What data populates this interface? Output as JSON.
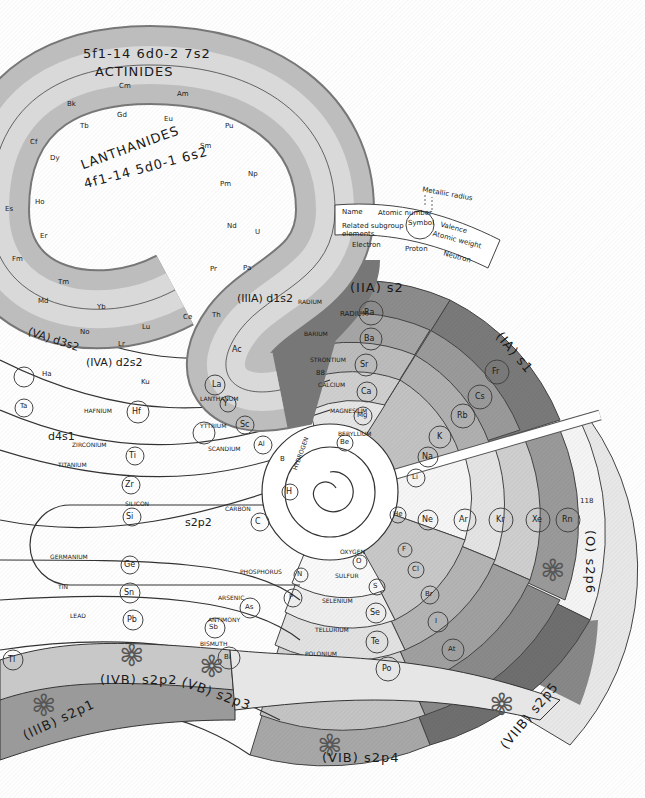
{
  "diagram": {
    "headers": {
      "actinides_config": "5f1-14 6d0-2 7s2",
      "actinides": "ACTINIDES",
      "lanthanides": "LANTHANIDES",
      "lanthanides_config": "4f1-14 5d0-1 6s2",
      "group_IIA": "(IIA) s2",
      "group_IA": "(IA) s1",
      "group_IIIA": "(IIIA) d1s2",
      "group_IVA": "(IVA) d2s2",
      "group_VA": "(VA) d3s2",
      "group_0": "(O) s2p6",
      "group_IIIB": "(IIIB) s2p1",
      "group_IVB": "(IVB) s2p2",
      "group_VB": "(VB) s2p3",
      "group_VIB": "(VIB) s2p4",
      "group_VIIB": "(VIIB) s2p5",
      "sp_s2p2": "s2p2",
      "d4s1": "d4s1",
      "s2p1_inner": "s2p1"
    },
    "legend": {
      "name": "Name",
      "atomic_number": "Atomic number",
      "symbol": "Symbol",
      "valence": "Valence",
      "atomic_weight": "Atomic weight",
      "related": "Related subgroup elements",
      "metallic_radius": "Metallic radius",
      "electron": "Electron",
      "proton": "Proton",
      "neutron": "Neutron"
    },
    "actinides": [
      {
        "n": "98",
        "sym": "Cf",
        "name": "CALIFORNIUM"
      },
      {
        "n": "97",
        "sym": "Bk",
        "name": "BERKELIUM"
      },
      {
        "n": "96",
        "sym": "Cm",
        "name": "CURIUM"
      },
      {
        "n": "95",
        "sym": "Am",
        "name": "AMERICIUM"
      },
      {
        "n": "94",
        "sym": "Pu",
        "name": "PLUTONIUM"
      },
      {
        "n": "93",
        "sym": "Np",
        "name": "NEPTUNIUM"
      },
      {
        "n": "92",
        "sym": "U",
        "name": "URANIUM"
      },
      {
        "n": "91",
        "sym": "Pa",
        "name": "PROTACTINIUM"
      },
      {
        "n": "90",
        "sym": "Th",
        "name": "THORIUM"
      },
      {
        "n": "89",
        "sym": "Ac",
        "name": "ACTINIUM"
      },
      {
        "n": "99",
        "sym": "Es",
        "name": "EINSTEINIUM"
      },
      {
        "n": "100",
        "sym": "Fm",
        "name": "FERMIUM"
      },
      {
        "n": "101",
        "sym": "Md",
        "name": "MENDELEVIUM"
      },
      {
        "n": "102",
        "sym": "No",
        "name": "NOBELIUM"
      },
      {
        "n": "103",
        "sym": "Lr",
        "name": "LAWRENCIUM"
      }
    ],
    "lanthanides": [
      {
        "n": "66",
        "sym": "Dy",
        "name": "DYSPROSIUM"
      },
      {
        "n": "65",
        "sym": "Tb",
        "name": "TERBIUM"
      },
      {
        "n": "64",
        "sym": "Gd",
        "name": "GADOLINIUM"
      },
      {
        "n": "63",
        "sym": "Eu",
        "name": "EUROPIUM"
      },
      {
        "n": "62",
        "sym": "Sm",
        "name": "SAMARIUM"
      },
      {
        "n": "61",
        "sym": "Pm",
        "name": "PROMETHIUM"
      },
      {
        "n": "60",
        "sym": "Nd",
        "name": "NEODYMIUM"
      },
      {
        "n": "59",
        "sym": "Pr",
        "name": "PRASEODYMIUM"
      },
      {
        "n": "58",
        "sym": "Ce",
        "name": "CERIUM"
      },
      {
        "n": "57",
        "sym": "La",
        "name": "LANTHANUM"
      },
      {
        "n": "67",
        "sym": "Ho",
        "name": "HOLMIUM"
      },
      {
        "n": "68",
        "sym": "Er",
        "name": "ERBIUM"
      },
      {
        "n": "69",
        "sym": "Tm",
        "name": "THULIUM"
      },
      {
        "n": "70",
        "sym": "Yb",
        "name": "YTTERBIUM"
      },
      {
        "n": "71",
        "sym": "Lu",
        "name": "LUTETIUM"
      }
    ],
    "group_IIA": [
      {
        "n": "88",
        "sym": "Ra",
        "name": "RADIUM"
      },
      {
        "n": "56",
        "sym": "Ba",
        "name": "BARIUM"
      },
      {
        "n": "38",
        "sym": "Sr",
        "name": "STRONTIUM"
      },
      {
        "n": "20",
        "sym": "Ca",
        "name": "CALCIUM"
      },
      {
        "n": "12",
        "sym": "Mg",
        "name": "MAGNESIUM"
      },
      {
        "n": "4",
        "sym": "Be",
        "name": "BERYLLIUM"
      }
    ],
    "group_IA": [
      {
        "n": "87",
        "sym": "Fr",
        "name": "FRANCIUM"
      },
      {
        "n": "55",
        "sym": "Cs",
        "name": "CESIUM"
      },
      {
        "n": "37",
        "sym": "Rb",
        "name": "RUBIDIUM"
      },
      {
        "n": "19",
        "sym": "K",
        "name": "POTASSIUM"
      },
      {
        "n": "11",
        "sym": "Na",
        "name": "SODIUM"
      },
      {
        "n": "3",
        "sym": "Li",
        "name": "LITHIUM"
      }
    ],
    "group_0": [
      {
        "n": "2",
        "sym": "He",
        "name": "HELIUM"
      },
      {
        "n": "10",
        "sym": "Ne",
        "name": "NEON"
      },
      {
        "n": "18",
        "sym": "Ar",
        "name": "ARGON"
      },
      {
        "n": "36",
        "sym": "Kr",
        "name": "KRYPTON"
      },
      {
        "n": "54",
        "sym": "Xe",
        "name": "XENON"
      },
      {
        "n": "86",
        "sym": "Rn",
        "name": "RADON"
      },
      {
        "n": "118",
        "sym": "*",
        "name": ""
      }
    ],
    "group_IIIA": [
      {
        "n": "21",
        "sym": "Sc",
        "name": "SCANDIUM"
      },
      {
        "n": "39",
        "sym": "Y",
        "name": "YTTRIUM"
      }
    ],
    "group_IVA": [
      {
        "n": "22",
        "sym": "Ti",
        "name": "TITANIUM"
      },
      {
        "n": "40",
        "sym": "Zr",
        "name": "ZIRCONIUM"
      },
      {
        "n": "72",
        "sym": "Hf",
        "name": "HAFNIUM"
      },
      {
        "n": "104",
        "sym": "Ku",
        "name": "KURCHATOVIUM"
      }
    ],
    "group_VA": [
      {
        "n": "73",
        "sym": "Ta",
        "name": "TANTALUM"
      },
      {
        "n": "105",
        "sym": "Ha",
        "name": "HAHNIUM"
      }
    ],
    "group_IIIB": [
      {
        "n": "13",
        "sym": "Al",
        "name": "ALUMINIUM"
      },
      {
        "n": "5",
        "sym": "B",
        "name": "BORON"
      },
      {
        "n": "81",
        "sym": "Tl",
        "name": "THALLIUM"
      },
      {
        "n": "113",
        "sym": "*",
        "name": ""
      }
    ],
    "group_IVB": [
      {
        "n": "6",
        "sym": "C",
        "name": "CARBON"
      },
      {
        "n": "14",
        "sym": "Si",
        "name": "SILICON"
      },
      {
        "n": "32",
        "sym": "Ge",
        "name": "GERMANIUM"
      },
      {
        "n": "50",
        "sym": "Sn",
        "name": "TIN"
      },
      {
        "n": "82",
        "sym": "Pb",
        "name": "LEAD"
      },
      {
        "n": "114",
        "sym": "*",
        "name": ""
      }
    ],
    "group_VB": [
      {
        "n": "7",
        "sym": "N",
        "name": "NITROGEN"
      },
      {
        "n": "15",
        "sym": "P",
        "name": "PHOSPHORUS"
      },
      {
        "n": "33",
        "sym": "As",
        "name": "ARSENIC"
      },
      {
        "n": "51",
        "sym": "Sb",
        "name": "ANTIMONY"
      },
      {
        "n": "83",
        "sym": "Bi",
        "name": "BISMUTH"
      },
      {
        "n": "115",
        "sym": "*",
        "name": ""
      }
    ],
    "group_VIB": [
      {
        "n": "8",
        "sym": "O",
        "name": "OXYGEN"
      },
      {
        "n": "16",
        "sym": "S",
        "name": "SULFUR"
      },
      {
        "n": "34",
        "sym": "Se",
        "name": "SELENIUM"
      },
      {
        "n": "52",
        "sym": "Te",
        "name": "TELLURIUM"
      },
      {
        "n": "84",
        "sym": "Po",
        "name": "POLONIUM"
      },
      {
        "n": "116",
        "sym": "*",
        "name": ""
      }
    ],
    "group_VIIB": [
      {
        "n": "9",
        "sym": "F",
        "name": "FLUORINE"
      },
      {
        "n": "17",
        "sym": "Cl",
        "name": "CHLORINE"
      },
      {
        "n": "35",
        "sym": "Br",
        "name": "BROMINE"
      },
      {
        "n": "53",
        "sym": "I",
        "name": "IODINE"
      },
      {
        "n": "85",
        "sym": "At",
        "name": "ASTATINE"
      },
      {
        "n": "117",
        "sym": "*",
        "name": ""
      }
    ],
    "hydrogen": {
      "n": "1",
      "sym": "H",
      "name": "HYDROGEN"
    },
    "period_numbers": [
      "1",
      "2",
      "3",
      "4",
      "5",
      "6",
      "7"
    ]
  }
}
